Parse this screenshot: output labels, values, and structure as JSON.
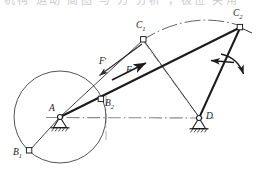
{
  "figure": {
    "type": "mechanism-kinematic-diagram",
    "width": 260,
    "height": 171,
    "background": "#ffffff",
    "top_cut_text": "机构 运动 简图 与 力 分析 ，极位 夹角"
  },
  "colors": {
    "ink": "#1b1b1b",
    "thin": "#4a4a4a",
    "center_line": "#8a8a8a",
    "arc": "#5c5c5c",
    "hatch": "#2b2b2b"
  },
  "labels": {
    "pivot_a": "A",
    "pivot_d": "D",
    "crank_b1": "B",
    "crank_b1_sub": "1",
    "crank_b2": "B",
    "crank_b2_sub": "2",
    "coupler_c1": "C",
    "coupler_c1_sub": "1",
    "coupler_c2": "C",
    "coupler_c2_sub": "2",
    "force_f": "F",
    "force_f_prime": "F",
    "force_f_prime_mark": "′"
  },
  "geometry": {
    "pivot_a": [
      60,
      117
    ],
    "pivot_d": [
      199,
      118
    ],
    "crank_circle": {
      "cx": 60,
      "cy": 117,
      "r": 46
    },
    "crank_b1": [
      29,
      151
    ],
    "crank_b2": [
      101,
      99
    ],
    "coupler_c1": [
      143,
      39
    ],
    "coupler_c2": [
      240,
      27
    ],
    "force_arrow_f": {
      "from": [
        97,
        83
      ],
      "to": [
        131,
        70
      ]
    },
    "force_arrow_f_prime": {
      "from": [
        143,
        44
      ],
      "to": [
        100,
        75
      ]
    },
    "motion_arrow_left": {
      "from": [
        233,
        62
      ],
      "to": [
        211,
        60
      ]
    },
    "motion_arrow_curve": {
      "from": [
        222,
        55
      ],
      "to": [
        243,
        76
      ]
    }
  },
  "annotations": {
    "arc_c1_c2": "coupler-point path arc",
    "center_line_ad": "frame centerline A-D",
    "center_line_c1d": "limit position centerline C1-D"
  }
}
